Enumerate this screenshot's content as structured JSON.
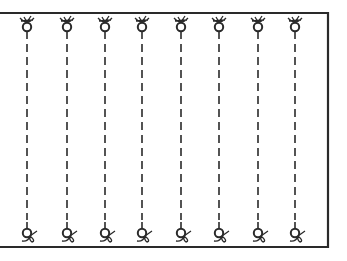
{
  "diagram": {
    "colors": {
      "ink": "#2a2a2a",
      "background": "#ffffff"
    },
    "frame": {
      "top_y": 13,
      "bottom_y": 247,
      "right_x": 328,
      "left_open": true
    },
    "strings": [
      {
        "x": 27
      },
      {
        "x": 67
      },
      {
        "x": 105
      },
      {
        "x": 142
      },
      {
        "x": 181
      },
      {
        "x": 219
      },
      {
        "x": 258
      },
      {
        "x": 295
      }
    ],
    "top_knot_y": 27,
    "bottom_knot_y": 233
  }
}
